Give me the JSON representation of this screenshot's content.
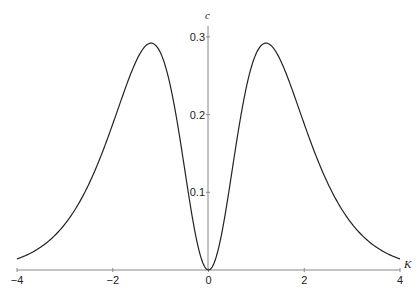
{
  "chart_data": {
    "type": "line",
    "title": "",
    "xlabel": "K",
    "ylabel": "c",
    "xlim": [
      -4,
      4
    ],
    "ylim": [
      0,
      0.31
    ],
    "grid": false,
    "legend": null,
    "x_ticks": [
      -4,
      -2,
      0,
      2,
      4
    ],
    "x_tick_labels": [
      "−4",
      "−2",
      "0",
      "2",
      "4"
    ],
    "y_ticks": [
      0.1,
      0.2,
      0.3
    ],
    "y_tick_labels": [
      "0.1",
      "0.2",
      "0.3"
    ],
    "series": [
      {
        "name": "c(K)",
        "color": "#222222",
        "x": [
          -4,
          -3.5,
          -3,
          -2.5,
          -2,
          -1.75,
          -1.5,
          -1.25,
          -1.2,
          -1,
          -0.75,
          -0.5,
          -0.25,
          0,
          0.25,
          0.5,
          0.75,
          1,
          1.2,
          1.25,
          1.5,
          1.75,
          2,
          2.5,
          3,
          3.5,
          4
        ],
        "y": [
          0.014,
          0.029,
          0.06,
          0.117,
          0.188,
          0.231,
          0.267,
          0.291,
          0.292,
          0.276,
          0.216,
          0.13,
          0.04,
          0.0,
          0.04,
          0.13,
          0.216,
          0.276,
          0.292,
          0.291,
          0.267,
          0.231,
          0.188,
          0.117,
          0.06,
          0.029,
          0.014
        ]
      }
    ]
  }
}
